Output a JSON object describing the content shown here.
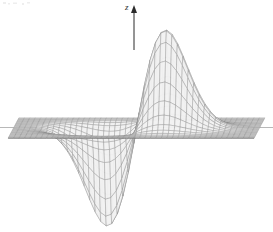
{
  "figure": {
    "name": "3d-surface-plot",
    "background_color": "#ffffff",
    "mesh_color": "#8a8a8a",
    "surface_fill_color": "#f2f2f2",
    "axis_color": "#2b2b2b"
  },
  "axes": {
    "z": {
      "label": "z",
      "icon": "up-arrow-icon",
      "x": 134,
      "top_y": 6,
      "bottom_y": 50
    }
  },
  "chart_data": {
    "type": "surface",
    "title": "",
    "subtitle": "",
    "xlabel": "",
    "ylabel": "",
    "zlabel": "z",
    "grid": true,
    "legend": null,
    "projection": "3d-wireframe",
    "surface_function": "z = x * exp(-(x^2 + y^2))",
    "xlim": [
      -3.0,
      3.0
    ],
    "ylim": [
      -3.0,
      3.0
    ],
    "zlim": [
      -1.0,
      1.0
    ],
    "mesh_u_lines": 46,
    "mesh_v_lines": 26,
    "features": [
      {
        "name": "peak-left",
        "sign": "positive",
        "screen_x": 118,
        "screen_y": 32,
        "z": 1.0
      },
      {
        "name": "peak-right",
        "sign": "positive",
        "screen_x": 145,
        "screen_y": 30,
        "z": 1.0
      },
      {
        "name": "valley-left",
        "sign": "negative",
        "screen_x": 100,
        "screen_y": 232,
        "z": -1.0
      },
      {
        "name": "valley-right",
        "sign": "negative",
        "screen_x": 165,
        "screen_y": 232,
        "z": -1.0
      }
    ],
    "baseline_plane_y": 128,
    "horizon_left_x": 0,
    "horizon_right_x": 273
  }
}
